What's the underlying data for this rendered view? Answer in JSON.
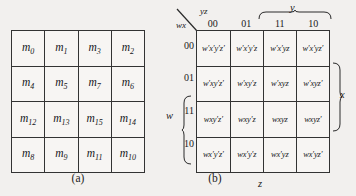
{
  "figure": {
    "title_a": "(a)",
    "title_b": "(b)"
  },
  "map_a": {
    "caption": "(a)",
    "rows": [
      [
        {
          "base": "m",
          "sub": "0"
        },
        {
          "base": "m",
          "sub": "1"
        },
        {
          "base": "m",
          "sub": "3"
        },
        {
          "base": "m",
          "sub": "2"
        }
      ],
      [
        {
          "base": "m",
          "sub": "4"
        },
        {
          "base": "m",
          "sub": "5"
        },
        {
          "base": "m",
          "sub": "7"
        },
        {
          "base": "m",
          "sub": "6"
        }
      ],
      [
        {
          "base": "m",
          "sub": "12"
        },
        {
          "base": "m",
          "sub": "13"
        },
        {
          "base": "m",
          "sub": "15"
        },
        {
          "base": "m",
          "sub": "14"
        }
      ],
      [
        {
          "base": "m",
          "sub": "8"
        },
        {
          "base": "m",
          "sub": "9"
        },
        {
          "base": "m",
          "sub": "11"
        },
        {
          "base": "m",
          "sub": "10"
        }
      ]
    ],
    "cells_flat": [
      "m0",
      "m1",
      "m3",
      "m2",
      "m4",
      "m5",
      "m7",
      "m6",
      "m12",
      "m13",
      "m15",
      "m14",
      "m8",
      "m9",
      "m11",
      "m10"
    ]
  },
  "map_b": {
    "caption": "(b)",
    "corner_row_vars": "wx",
    "corner_col_vars": "yz",
    "column_headers": [
      "00",
      "01",
      "11",
      "10"
    ],
    "row_headers": [
      "00",
      "01",
      "11",
      "10"
    ],
    "group_labels": {
      "y": "y",
      "z": "z",
      "x": "x",
      "w": "w"
    },
    "rows": [
      [
        "w′x′y′z′",
        "w′x′y′z",
        "w′x′yz",
        "w′x′yz′"
      ],
      [
        "w′xy′z′",
        "w′xy′z",
        "w′xyz",
        "w′xyz′"
      ],
      [
        "wxy′z′",
        "wxy′z",
        "wxyz",
        "wxyz′"
      ],
      [
        "wx′y′z′",
        "wx′y′z",
        "wx′yz",
        "wx′yz′"
      ]
    ]
  },
  "colors": {
    "background": "#f2f0ee",
    "cell_background": "#f7f5f3",
    "border": "#333333",
    "text": "#1a1a1a"
  }
}
